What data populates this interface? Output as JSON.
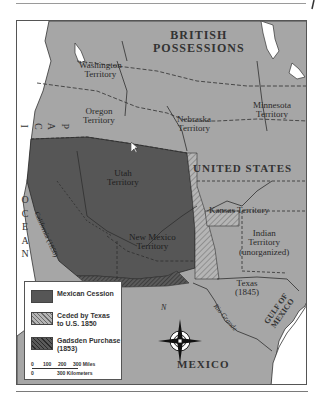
{
  "map": {
    "title_region_labels": {
      "british_possessions": [
        "BRITISH",
        "POSSESSIONS"
      ],
      "united_states": "UNITED STATES",
      "mexico": "MEXICO",
      "pacific_ocean": [
        "P",
        "A",
        "C",
        "I",
        "F",
        "I",
        "C"
      ],
      "ocean": [
        "O",
        "C",
        "E",
        "A",
        "N"
      ],
      "gulf_of_mexico": [
        "GULF OF",
        "MEXICO"
      ]
    },
    "territories": {
      "washington": [
        "Washington",
        "Territory"
      ],
      "oregon": [
        "Oregon",
        "Territory"
      ],
      "nebraska": [
        "Nebraska",
        "Territory"
      ],
      "minnesota": [
        "Minnesota",
        "Territory"
      ],
      "utah": [
        "Utah",
        "Territory"
      ],
      "california": "California (1850)",
      "kansas": "Kansas Territory",
      "new_mexico": [
        "New Mexico",
        "Territory"
      ],
      "indian": [
        "Indian",
        "Territory",
        "(unorganized)"
      ],
      "texas": [
        "Texas",
        "(1845)"
      ],
      "rio_grande": "Rio Grande"
    },
    "compass": {
      "north_label": "N"
    },
    "legend": {
      "items": [
        {
          "label": [
            "Mexican Cession"
          ],
          "pattern": "solid-dark",
          "color": "#555555"
        },
        {
          "label": [
            "Ceded by Texas",
            "to U.S. 1850"
          ],
          "pattern": "light-hatch",
          "color": "#9a9a9a"
        },
        {
          "label": [
            "Gadsden Purchase",
            "(1853)"
          ],
          "pattern": "dark-hatch",
          "color": "#4a4a4a"
        }
      ],
      "scale": {
        "miles_ticks": [
          "0",
          "100",
          "200",
          "300 Miles"
        ],
        "km_ticks": [
          "0",
          "300 Kilometers"
        ]
      }
    },
    "colors": {
      "land": "#a6a6a6",
      "cession": "#565656",
      "water": "#ffffff",
      "border": "#2e2e2e"
    }
  }
}
